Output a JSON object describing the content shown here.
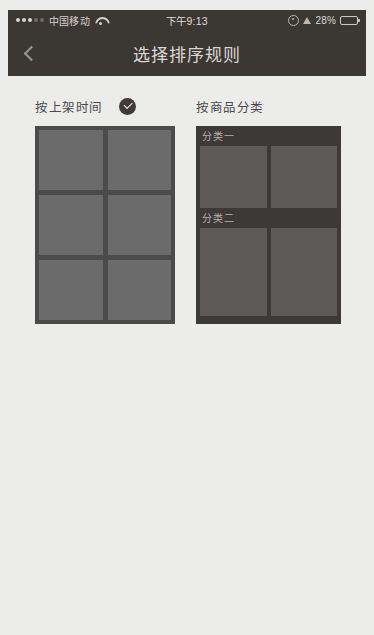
{
  "status_bar": {
    "signal_dots": 5,
    "signal_active": 3,
    "carrier": "中国移动",
    "wifi_icon": "wifi-icon",
    "time": "下午9:13",
    "rotation_lock_icon": "rotation-lock-icon",
    "location_icon": "location-arrow-icon",
    "battery_percent": "28%",
    "battery_level": 28
  },
  "nav_bar": {
    "back_icon": "chevron-left-icon",
    "title": "选择排序规则"
  },
  "options": [
    {
      "id": "by-listing-time",
      "label": "按上架时间",
      "selected": true,
      "check_icon": "check-circle-icon",
      "preview_type": "plain-grid",
      "tile_rows": 3,
      "tile_cols": 2
    },
    {
      "id": "by-product-category",
      "label": "按商品分类",
      "selected": false,
      "preview_type": "categorized-grid",
      "categories": [
        {
          "title": "分类一",
          "tile_count": 2
        },
        {
          "title": "分类二",
          "tile_count": 2
        },
        {
          "title": "",
          "tile_count": 2
        }
      ]
    }
  ],
  "colors": {
    "page_background": "#ececeb",
    "bar_background": "#3b3733",
    "bar_text": "#dcd8d4",
    "label_text": "#4a4a4a",
    "check_badge": "#3f3b38",
    "preview_plain_bg": "#4b4b4b",
    "preview_plain_tile": "#6b6b6b",
    "preview_cat_bg": "#3c3936",
    "preview_cat_tile": "#5d5a57",
    "cat_title_text": "#b9b3ad"
  }
}
